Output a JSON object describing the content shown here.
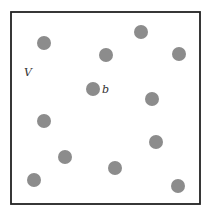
{
  "diagram": {
    "frame": {
      "x": 11,
      "y": 12,
      "width": 189,
      "height": 192,
      "stroke": "#222222",
      "stroke_width": 1.8
    },
    "dot_color": "#8c8c8c",
    "dot_radius": 7,
    "dots": [
      {
        "x": 44,
        "y": 43
      },
      {
        "x": 106,
        "y": 55
      },
      {
        "x": 141,
        "y": 32
      },
      {
        "x": 179,
        "y": 54
      },
      {
        "x": 93,
        "y": 89,
        "label": "b"
      },
      {
        "x": 152,
        "y": 99
      },
      {
        "x": 44,
        "y": 121
      },
      {
        "x": 65,
        "y": 157
      },
      {
        "x": 156,
        "y": 142
      },
      {
        "x": 115,
        "y": 168
      },
      {
        "x": 34,
        "y": 180
      },
      {
        "x": 178,
        "y": 186
      }
    ],
    "labels": {
      "set_label": {
        "text": "V",
        "x": 24,
        "y": 76
      },
      "point_label": {
        "text": "b",
        "x": 102,
        "y": 93
      }
    }
  }
}
